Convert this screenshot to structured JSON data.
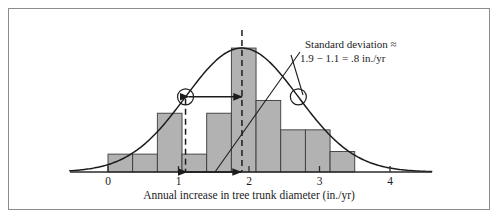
{
  "figure": {
    "border_color": "#8c8c8c",
    "background": "#ffffff"
  },
  "annotation": {
    "line1": "Standard deviation ≈",
    "line2": "1.9 − 1.1 = .8 in./yr"
  },
  "axis": {
    "caption": "Annual increase in tree trunk diameter (in./yr)",
    "tick_labels": [
      "0",
      "1",
      "2",
      "3",
      "4"
    ]
  },
  "chart_data": {
    "type": "bar",
    "title": "",
    "xlabel": "Annual increase in tree trunk diameter (in./yr)",
    "ylabel": "",
    "xlim": [
      -0.55,
      4.6
    ],
    "ylim": [
      0,
      1.08
    ],
    "grid": false,
    "legend": "none",
    "tick_values": [
      0,
      1,
      2,
      3,
      4
    ],
    "tick_labels": [
      "0",
      "1",
      "2",
      "3",
      "4"
    ],
    "bar_width": 0.35,
    "bar_fill": "#b2b2b2",
    "bar_edge": "#3a3a3a",
    "bin_left_edges": [
      0.0,
      0.35,
      0.7,
      1.05,
      1.4,
      1.75,
      2.1,
      2.45,
      2.8,
      3.15
    ],
    "bin_right_edges": [
      0.35,
      0.7,
      1.05,
      1.4,
      1.75,
      2.1,
      2.45,
      2.8,
      3.15,
      3.5
    ],
    "values": [
      0.14,
      0.14,
      0.46,
      0.14,
      0.46,
      0.97,
      0.56,
      0.33,
      0.33,
      0.16
    ],
    "overlay_curve": {
      "type": "normal",
      "mean": 1.9,
      "std": 0.8,
      "peak_height": 0.97,
      "stroke": "#1c1c1c"
    },
    "markers": {
      "inflection_points_x": [
        1.1,
        2.7
      ],
      "dashed_vertical_lines_x": [
        1.1,
        1.9
      ],
      "arrow_span_x": [
        1.1,
        1.9
      ],
      "arrow_label": "1.9 − 1.1 = .8 in./yr"
    }
  }
}
